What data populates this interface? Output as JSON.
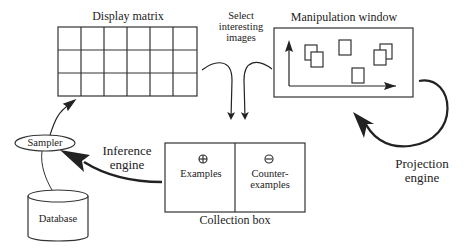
{
  "diagram": {
    "display_matrix": {
      "title": "Display matrix",
      "rows": 3,
      "cols": 6
    },
    "select_label": {
      "line1": "Select",
      "line2": "interesting",
      "line3": "images"
    },
    "manipulation_window": {
      "title": "Manipulation window"
    },
    "projection_engine": {
      "line1": "Projection",
      "line2": "engine"
    },
    "collection_box": {
      "title": "Collection box",
      "examples": {
        "symbol": "+",
        "label": "Examples"
      },
      "counter_examples": {
        "symbol": "−",
        "line1": "Counter-",
        "line2": "examples"
      }
    },
    "inference_engine": {
      "line1": "Inference",
      "line2": "engine"
    },
    "sampler": {
      "label": "Sampler"
    },
    "database": {
      "label": "Database"
    },
    "colors": {
      "stroke": "#333333",
      "background": "#ffffff"
    }
  }
}
